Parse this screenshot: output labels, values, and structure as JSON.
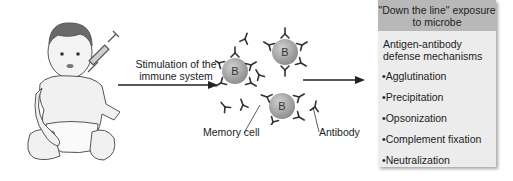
{
  "figure": {
    "stimulation_label": "Stimulation of the immune system",
    "memory_cell_label": "Memory cell",
    "antibody_label": "Antibody",
    "b_cell_letter": "B",
    "box": {
      "header": "\"Down the line\" exposure to microbe",
      "subtitle": "Antigen-antibody defense mechanisms",
      "items": [
        "•Agglutination",
        "•Precipitation",
        "•Opsonization",
        "•Complement fixation",
        "•Neutralization"
      ]
    },
    "colors": {
      "box_header": "#b8b8b8",
      "box_body": "#ececec",
      "b_cell": "#a8a8a8",
      "arrow": "#222222"
    }
  }
}
